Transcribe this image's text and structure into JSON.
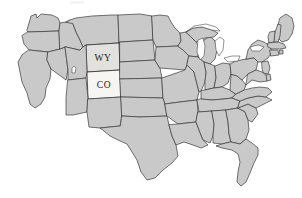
{
  "figure": {
    "kind": "choropleth-outline-map",
    "region": "United States (contiguous 48 states)",
    "background_color": "#ffffff",
    "default_state_fill": "#c9c9c9",
    "state_border_color": "#3a3a3a",
    "lake_fill": "#ffffff",
    "label_color": "#1d1d1d"
  },
  "highlights": [
    {
      "code": "WY",
      "label": "WY",
      "fill": "#e2e1dd",
      "label_x": 103,
      "label_y": 62
    },
    {
      "code": "CO",
      "label": "CO",
      "fill": "#f6f5f1",
      "label_x": 108,
      "label_y": 93
    }
  ],
  "labels": {
    "wy": "WY",
    "co": "CO"
  },
  "artifact": {
    "present": true,
    "description": "faint light smudge near top edge"
  }
}
